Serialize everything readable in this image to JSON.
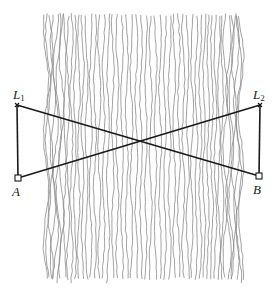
{
  "diagram": {
    "stripes": {
      "x_start": 46,
      "x_end": 241,
      "y_top": 13,
      "y_bottom": 284,
      "count": 52,
      "color": "#8a8a8a"
    },
    "points": {
      "L1": {
        "label": "L",
        "sub": "1",
        "x": 17,
        "y": 105
      },
      "L2": {
        "label": "L",
        "sub": "2",
        "x": 260,
        "y": 105
      },
      "A": {
        "label": "A",
        "x": 18,
        "y": 178
      },
      "B": {
        "label": "B",
        "x": 259,
        "y": 176
      }
    },
    "segments": [
      {
        "from": "L1",
        "to": "A"
      },
      {
        "from": "L1",
        "to": "B"
      },
      {
        "from": "A",
        "to": "L2"
      },
      {
        "from": "L2",
        "to": "B"
      }
    ],
    "line_color": "#1a1a1a"
  }
}
